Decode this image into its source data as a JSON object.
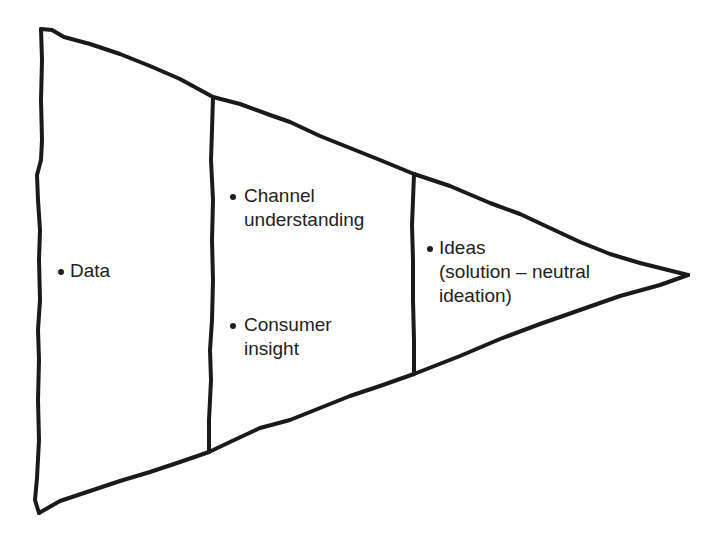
{
  "diagram": {
    "type": "funnel-triangle",
    "stroke_color": "#1a1a1a",
    "background_color": "#ffffff",
    "stages": [
      {
        "id": "stage-1",
        "items": [
          {
            "lines": [
              "Data"
            ]
          }
        ]
      },
      {
        "id": "stage-2",
        "items": [
          {
            "lines": [
              "Channel",
              "understanding"
            ]
          },
          {
            "lines": [
              "Consumer",
              "insight"
            ]
          }
        ]
      },
      {
        "id": "stage-3",
        "items": [
          {
            "lines": [
              "Ideas",
              "(solution – neutral",
              "ideation)"
            ]
          }
        ]
      }
    ]
  }
}
